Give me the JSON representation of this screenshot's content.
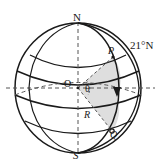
{
  "figure": {
    "type": "geometry-diagram",
    "labels": {
      "north_pole": "N",
      "south_pole": "S",
      "center": "O",
      "point_p": "P",
      "point_q": "Q",
      "angle": "θ",
      "radius": "R",
      "latitude": "21°N"
    },
    "colors": {
      "line": "#1a1a1a",
      "sector_fill": "#dcdcdc",
      "background": "#ffffff",
      "dashed": "#555555"
    },
    "geometry": {
      "center_x": 78,
      "center_y": 88,
      "radius_x": 63,
      "radius_y": 65,
      "latitude_degrees": 21
    },
    "icons": {
      "direction_marker": "down-triangle-arrow"
    }
  }
}
